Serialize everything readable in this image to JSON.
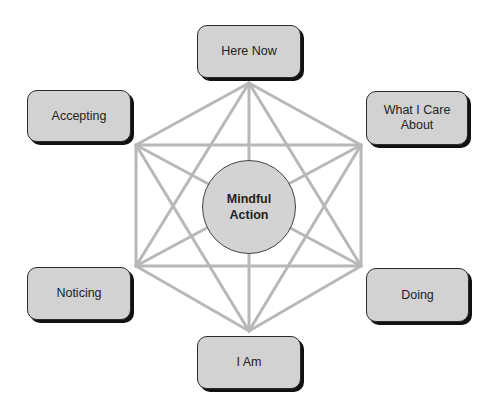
{
  "diagram": {
    "center": {
      "label": "Mindful Action",
      "fill": "#d3d3d3"
    },
    "nodes": [
      {
        "id": "here-now",
        "label": "Here Now",
        "position": "top"
      },
      {
        "id": "what-i-care-about",
        "label": "What I Care About",
        "position": "upper-right"
      },
      {
        "id": "doing",
        "label": "Doing",
        "position": "lower-right"
      },
      {
        "id": "i-am",
        "label": "I Am",
        "position": "bottom"
      },
      {
        "id": "noticing",
        "label": "Noticing",
        "position": "lower-left"
      },
      {
        "id": "accepting",
        "label": "Accepting",
        "position": "upper-left"
      }
    ],
    "colors": {
      "node_fill": "#d2d2d2",
      "node_border": "#2a2a2a",
      "node_shadow": "#111111",
      "line": "#b8b8b8"
    },
    "shape": "hexagon with all vertex-to-vertex connections (hexaflex)"
  }
}
